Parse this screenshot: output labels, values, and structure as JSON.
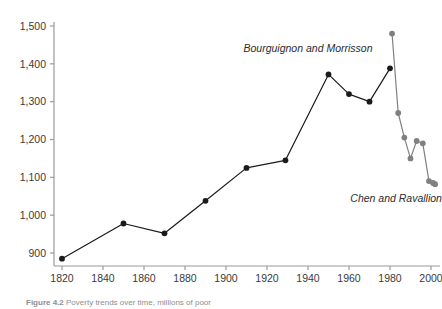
{
  "chart_data": {
    "type": "line",
    "title": "",
    "subtitle": "",
    "xlabel": "",
    "ylabel": "",
    "xlim": [
      1815,
      2005
    ],
    "ylim": [
      860,
      1500
    ],
    "grid": false,
    "legend_position": "inline-annotations",
    "x_ticks": [
      "1820",
      "1840",
      "1860",
      "1880",
      "1900",
      "1920",
      "1940",
      "1960",
      "1980",
      "2000"
    ],
    "x_tick_values": [
      1820,
      1840,
      1860,
      1880,
      1900,
      1920,
      1940,
      1960,
      1980,
      2000
    ],
    "y_ticks": [
      "900",
      "1,000",
      "1,100",
      "1,200",
      "1,300",
      "1,400",
      "1,500"
    ],
    "y_tick_values": [
      900,
      1000,
      1100,
      1200,
      1300,
      1400,
      1500
    ],
    "series": [
      {
        "name": "Bourguignon and Morrisson",
        "color": "#1a1a1a",
        "marker": "circle",
        "label_x": 1940,
        "label_y": 1432,
        "x": [
          1820,
          1850,
          1870,
          1890,
          1910,
          1929,
          1950,
          1960,
          1970,
          1980
        ],
        "values": [
          885,
          978,
          952,
          1038,
          1125,
          1145,
          1372,
          1320,
          1300,
          1388
        ]
      },
      {
        "name": "Chen and Ravallion",
        "color": "#808080",
        "marker": "circle",
        "label_x": 1983,
        "label_y": 1035,
        "x": [
          1981,
          1984,
          1987,
          1990,
          1993,
          1996,
          1999,
          2001,
          2002
        ],
        "values": [
          1480,
          1270,
          1205,
          1150,
          1196,
          1190,
          1090,
          1085,
          1082
        ]
      }
    ]
  },
  "caption": {
    "prefix": "Figure 4.2",
    "text": "Poverty trends over time, millions of poor"
  },
  "colors": {
    "axis": "#9a9a9a",
    "tick_text": "#3a3a3a",
    "series_black": "#1a1a1a",
    "series_gray": "#808080",
    "background": "#ffffff"
  }
}
